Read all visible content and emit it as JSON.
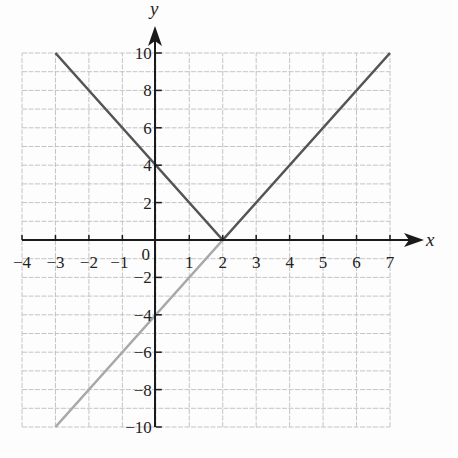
{
  "chart_data": {
    "type": "line",
    "title": "",
    "xlabel": "x",
    "ylabel": "y",
    "xlim": [
      -4,
      7
    ],
    "ylim": [
      -10,
      10
    ],
    "grid": true,
    "grid_step": {
      "x": 1,
      "y": 1
    },
    "x_ticks": [
      -4,
      -3,
      -2,
      -1,
      0,
      1,
      2,
      3,
      4,
      5,
      6,
      7
    ],
    "x_tick_labels": [
      "−4",
      "−3",
      "−2",
      "−1",
      "0",
      "1",
      "2",
      "3",
      "4",
      "5",
      "6",
      "7"
    ],
    "y_ticks": [
      10,
      8,
      6,
      4,
      2,
      -2,
      -4,
      -6,
      -8,
      -10
    ],
    "y_tick_labels": [
      "10",
      "8",
      "6",
      "4",
      "2",
      "−2",
      "−4",
      "−6",
      "−8",
      "−10"
    ],
    "series": [
      {
        "name": "y = 2|x − 2|",
        "color": "#555555",
        "points": [
          [
            -3,
            10
          ],
          [
            2,
            0
          ],
          [
            7,
            10
          ]
        ]
      },
      {
        "name": "y = 2x − 4",
        "color": "#a8a8a8",
        "points": [
          [
            -3,
            -10
          ],
          [
            2,
            0
          ]
        ]
      }
    ]
  },
  "labels": {
    "x_axis": "x",
    "y_axis": "y",
    "origin": "0"
  }
}
